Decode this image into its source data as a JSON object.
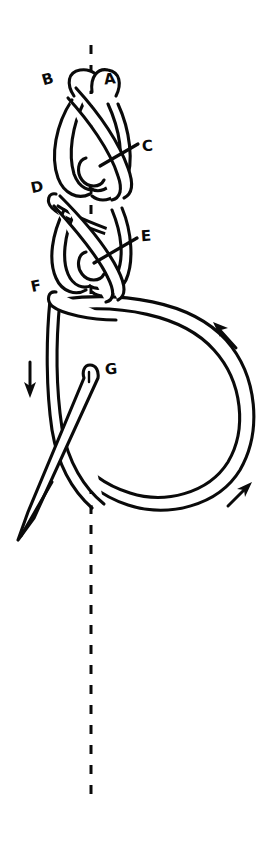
{
  "figure": {
    "background_color": "#ffffff",
    "ink_color": "#0a0a0a",
    "width": 276,
    "height": 851
  },
  "labels": [
    {
      "id": "A",
      "text": "A",
      "x": 104,
      "y": 72
    },
    {
      "id": "B",
      "text": "B",
      "x": 42,
      "y": 72
    },
    {
      "id": "C",
      "text": "C",
      "x": 142,
      "y": 139
    },
    {
      "id": "D",
      "text": "D",
      "x": 31,
      "y": 180
    },
    {
      "id": "E",
      "text": "E",
      "x": 141,
      "y": 229
    },
    {
      "id": "F",
      "text": "F",
      "x": 31,
      "y": 279
    },
    {
      "id": "G",
      "text": "G",
      "x": 105,
      "y": 362
    }
  ],
  "leader_lines": [
    {
      "id": "leader-c",
      "from_label": "C",
      "x1": 138,
      "y1": 144,
      "x2": 100,
      "y2": 166
    },
    {
      "id": "leader-e",
      "from_label": "E",
      "x1": 137,
      "y1": 238,
      "x2": 94,
      "y2": 263
    }
  ],
  "axis": {
    "name": "center-axis",
    "style": "dashed",
    "x": 91,
    "y_top": 45,
    "y_bottom": 802
  },
  "arrows": [
    {
      "id": "arrow-down-left",
      "direction": "down",
      "x": 30,
      "y": 380
    },
    {
      "id": "arrow-up-left-upper-right",
      "direction": "up-left",
      "x": 218,
      "y": 328
    },
    {
      "id": "arrow-up-right-lower-right",
      "direction": "up-right",
      "x": 244,
      "y": 489
    }
  ],
  "needle": {
    "name": "needle",
    "eye_x": 88,
    "eye_y": 368,
    "tip_x": 18,
    "tip_y": 538,
    "has_tapered_point": true
  },
  "loop": {
    "name": "working-loop",
    "right_extent": 258,
    "bottom_extent": 508,
    "top": 296
  },
  "knot_sections": [
    {
      "id": "section-ab",
      "label_pair": "A-B",
      "description": "top crossing loop"
    },
    {
      "id": "section-c",
      "label_pair": "C",
      "description": "first bight"
    },
    {
      "id": "section-d",
      "label_pair": "D",
      "description": "second crossing"
    },
    {
      "id": "section-e",
      "label_pair": "E",
      "description": "second bight"
    },
    {
      "id": "section-f",
      "label_pair": "F",
      "description": "third crossing"
    },
    {
      "id": "section-g",
      "label_pair": "G",
      "description": "needle eye at loop"
    }
  ]
}
